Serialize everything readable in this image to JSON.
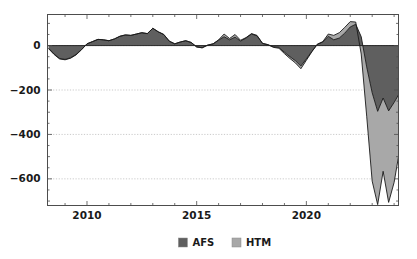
{
  "chart_data": {
    "type": "area",
    "stacked": true,
    "title": "",
    "subtitle": "",
    "xlabel": "",
    "ylabel": "",
    "xlim": [
      2008.2,
      2024.2
    ],
    "ylim": [
      -720,
      140
    ],
    "grid": true,
    "legend_position": "bottom",
    "x_ticks_major": [
      2010,
      2015,
      2020
    ],
    "x_tick_labels": [
      "2010",
      "2015",
      "2020"
    ],
    "x_ticks_minor": [
      2009,
      2011,
      2012,
      2013,
      2014,
      2016,
      2017,
      2018,
      2019,
      2021,
      2022,
      2023,
      2024
    ],
    "y_ticks_major": [
      0,
      -200,
      -400,
      -600
    ],
    "y_tick_labels": [
      "0",
      "−200",
      "−400",
      "−600"
    ],
    "y_ticks_minor": [
      100,
      -100,
      -300,
      -500,
      -700
    ],
    "colors": {
      "AFS": "#5f5f5f",
      "HTM": "#a8a8a8",
      "outline": "#1a1a1a",
      "grid": "#b3b3b3",
      "axis": "#4d4d4d",
      "background": "#ffffff"
    },
    "x": [
      2008.25,
      2008.5,
      2008.75,
      2009.0,
      2009.25,
      2009.5,
      2009.75,
      2010.0,
      2010.25,
      2010.5,
      2010.75,
      2011.0,
      2011.25,
      2011.5,
      2011.75,
      2012.0,
      2012.25,
      2012.5,
      2012.75,
      2013.0,
      2013.25,
      2013.5,
      2013.75,
      2014.0,
      2014.25,
      2014.5,
      2014.75,
      2015.0,
      2015.25,
      2015.5,
      2015.75,
      2016.0,
      2016.25,
      2016.5,
      2016.75,
      2017.0,
      2017.25,
      2017.5,
      2017.75,
      2018.0,
      2018.25,
      2018.5,
      2018.75,
      2019.0,
      2019.25,
      2019.5,
      2019.75,
      2020.0,
      2020.25,
      2020.5,
      2020.75,
      2021.0,
      2021.25,
      2021.5,
      2021.75,
      2022.0,
      2022.25,
      2022.5,
      2022.75,
      2023.0,
      2023.25,
      2023.5,
      2023.75,
      2024.0,
      2024.2
    ],
    "series": [
      {
        "name": "AFS",
        "label": "AFS",
        "color": "#5f5f5f",
        "values": [
          -12,
          -38,
          -58,
          -62,
          -55,
          -40,
          -18,
          8,
          18,
          28,
          26,
          22,
          30,
          42,
          48,
          46,
          52,
          58,
          54,
          78,
          62,
          50,
          20,
          8,
          16,
          22,
          14,
          -6,
          -10,
          2,
          8,
          24,
          40,
          26,
          38,
          20,
          34,
          52,
          44,
          10,
          4,
          -6,
          -8,
          -30,
          -50,
          -68,
          -92,
          -60,
          -26,
          6,
          16,
          42,
          26,
          34,
          56,
          84,
          96,
          40,
          -96,
          -212,
          -296,
          -236,
          -294,
          -256,
          -222
        ]
      },
      {
        "name": "HTM",
        "label": "HTM",
        "color": "#a8a8a8",
        "values": [
          -2,
          -2,
          -2,
          -2,
          -2,
          -2,
          -1,
          0,
          0,
          0,
          0,
          0,
          0,
          0,
          0,
          0,
          0,
          0,
          0,
          0,
          0,
          0,
          0,
          0,
          0,
          0,
          0,
          0,
          0,
          0,
          0,
          2,
          12,
          6,
          12,
          4,
          2,
          2,
          2,
          0,
          0,
          -2,
          -4,
          -6,
          -8,
          -10,
          -12,
          -6,
          -2,
          0,
          2,
          10,
          20,
          24,
          26,
          24,
          10,
          -78,
          -222,
          -398,
          -420,
          -330,
          -412,
          -360,
          -278
        ]
      }
    ],
    "legend": [
      {
        "label": "AFS",
        "color": "#5f5f5f"
      },
      {
        "label": "HTM",
        "color": "#a8a8a8"
      }
    ]
  }
}
